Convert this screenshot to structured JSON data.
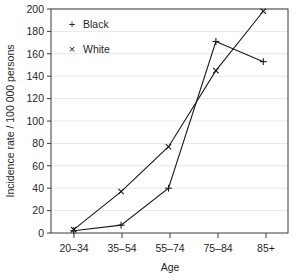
{
  "chart_data": {
    "type": "line",
    "title": "",
    "subtitle": "",
    "xlabel": "Age",
    "ylabel": "Incidence rate / 100 000 persons",
    "categories": [
      "20–34",
      "35–54",
      "55–74",
      "75–84",
      "85+"
    ],
    "series": [
      {
        "name": "Black",
        "marker": "plus",
        "marker_glyph": "+",
        "values": [
          2,
          7,
          40,
          171,
          153
        ]
      },
      {
        "name": "White",
        "marker": "cross",
        "marker_glyph": "×",
        "values": [
          3,
          37,
          77,
          145,
          198
        ]
      }
    ],
    "ylim": [
      0,
      200
    ],
    "ytick_step": 20,
    "yticks": [
      "0",
      "20",
      "40",
      "60",
      "80",
      "100",
      "120",
      "140",
      "160",
      "180",
      "200"
    ],
    "xlim_categories": 5,
    "grid": "horizontal",
    "legend_position": "top-left",
    "line_color": "#1a1a1a",
    "grid_color": "#e2e2e2",
    "frame_color": "#3a3a3a",
    "background_color": "#ffffff"
  },
  "legend": {
    "entries": [
      {
        "glyph": "+",
        "label": "Black"
      },
      {
        "glyph": "×",
        "label": "White"
      }
    ]
  },
  "axes": {
    "y_title": "Incidence rate / 100 000 persons",
    "x_title": "Age",
    "y_ticks": [
      {
        "value": "200"
      },
      {
        "value": "180"
      },
      {
        "value": "160"
      },
      {
        "value": "140"
      },
      {
        "value": "120"
      },
      {
        "value": "100"
      },
      {
        "value": "80"
      },
      {
        "value": "60"
      },
      {
        "value": "40"
      },
      {
        "value": "20"
      },
      {
        "value": "0"
      }
    ],
    "x_ticks": [
      {
        "value": "20–34"
      },
      {
        "value": "35–54"
      },
      {
        "value": "55–74"
      },
      {
        "value": "75–84"
      },
      {
        "value": "85+"
      }
    ]
  }
}
